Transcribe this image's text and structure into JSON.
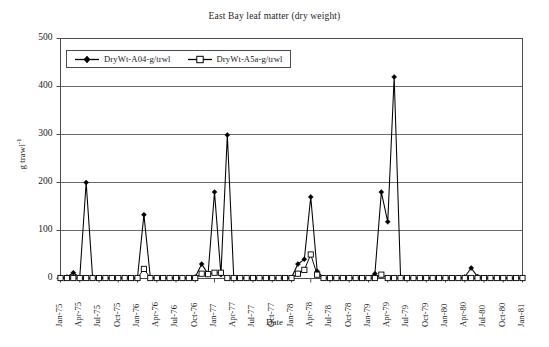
{
  "chart": {
    "title": "East Bay leaf matter (dry weight)",
    "xlabel": "Date",
    "ylabel_main": "g trawl",
    "ylabel_sup": "-1",
    "legend": [
      {
        "label": "DryWt-A04-g/trwl",
        "marker": "filled-diamond-icon",
        "color": "#000000"
      },
      {
        "label": "DryWt-A5a-g/trwl",
        "marker": "open-square-icon",
        "color": "#000000"
      }
    ]
  },
  "chart_data": {
    "type": "line",
    "title": "East Bay leaf matter (dry weight)",
    "xlabel": "Date",
    "ylabel": "g trawl^-1",
    "ylim": [
      0,
      500
    ],
    "yticks": [
      0,
      100,
      200,
      300,
      400,
      500
    ],
    "grid": true,
    "legend_position": "top-left-inside",
    "x_tick_labels": [
      "Jan-75",
      "Apr-75",
      "Jul-75",
      "Oct-75",
      "Jan-76",
      "Apr-76",
      "Jul-76",
      "Oct-76",
      "Jan-77",
      "Apr-77",
      "Jul-77",
      "Oct-77",
      "Jan-78",
      "Apr-78",
      "Jul-78",
      "Oct-78",
      "Jan-79",
      "Apr-79",
      "Jul-79",
      "Oct-79",
      "Jan-80",
      "Apr-80",
      "Jul-80",
      "Oct-80",
      "Jan-81"
    ],
    "x_tick_interval_months": 3,
    "x": [
      "Jan-75",
      "Feb-75",
      "Mar-75",
      "Apr-75",
      "May-75",
      "Jun-75",
      "Jul-75",
      "Aug-75",
      "Sep-75",
      "Oct-75",
      "Nov-75",
      "Dec-75",
      "Jan-76",
      "Feb-76",
      "Mar-76",
      "Apr-76",
      "May-76",
      "Jun-76",
      "Jul-76",
      "Aug-76",
      "Sep-76",
      "Oct-76",
      "Nov-76",
      "Dec-76",
      "Jan-77",
      "Feb-77",
      "Mar-77",
      "Apr-77",
      "May-77",
      "Jun-77",
      "Jul-77",
      "Aug-77",
      "Sep-77",
      "Oct-77",
      "Nov-77",
      "Dec-77",
      "Jan-78",
      "Feb-78",
      "Mar-78",
      "Apr-78",
      "May-78",
      "Jun-78",
      "Jul-78",
      "Aug-78",
      "Sep-78",
      "Oct-78",
      "Nov-78",
      "Dec-78",
      "Jan-79",
      "Feb-79",
      "Mar-79",
      "Apr-79",
      "May-79",
      "Jun-79",
      "Jul-79",
      "Aug-79",
      "Sep-79",
      "Oct-79",
      "Nov-79",
      "Dec-79",
      "Jan-80",
      "Feb-80",
      "Mar-80",
      "Apr-80",
      "May-80",
      "Jun-80",
      "Jul-80",
      "Aug-80",
      "Sep-80",
      "Oct-80",
      "Nov-80",
      "Dec-80",
      "Jan-81"
    ],
    "series": [
      {
        "name": "DryWt-A04-g/trwl",
        "marker": "filled diamond",
        "values": [
          2,
          3,
          12,
          2,
          200,
          3,
          2,
          1,
          1,
          1,
          1,
          1,
          2,
          133,
          2,
          1,
          1,
          1,
          1,
          1,
          2,
          3,
          30,
          10,
          180,
          8,
          299,
          2,
          1,
          1,
          1,
          1,
          1,
          1,
          1,
          1,
          2,
          30,
          40,
          170,
          15,
          2,
          1,
          1,
          1,
          1,
          1,
          1,
          2,
          10,
          180,
          118,
          420,
          2,
          1,
          1,
          1,
          1,
          1,
          1,
          1,
          1,
          2,
          3,
          22,
          4,
          2,
          1,
          1,
          1,
          1,
          1,
          1
        ]
      },
      {
        "name": "DryWt-A5a-g/trwl",
        "marker": "open square",
        "values": [
          1,
          1,
          1,
          1,
          1,
          1,
          1,
          1,
          1,
          1,
          1,
          1,
          1,
          20,
          1,
          1,
          1,
          1,
          1,
          1,
          1,
          1,
          10,
          9,
          12,
          12,
          1,
          1,
          1,
          1,
          1,
          1,
          1,
          1,
          1,
          1,
          1,
          10,
          18,
          50,
          8,
          1,
          1,
          1,
          1,
          1,
          1,
          1,
          1,
          1,
          8,
          1,
          1,
          1,
          1,
          1,
          1,
          1,
          1,
          1,
          1,
          1,
          1,
          1,
          1,
          1,
          1,
          1,
          1,
          1,
          1,
          1,
          1
        ]
      }
    ]
  }
}
